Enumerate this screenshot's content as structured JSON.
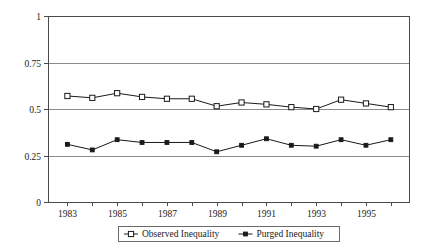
{
  "chart_data": {
    "type": "line",
    "title": "",
    "xlabel": "",
    "ylabel": "",
    "ylim": [
      0,
      1
    ],
    "xlim": [
      1983,
      1996
    ],
    "grid": true,
    "legend_position": "bottom",
    "yticks": [
      "0",
      "0.25",
      "0.5",
      "0.75",
      "1"
    ],
    "ytick_values": [
      0,
      0.25,
      0.5,
      0.75,
      1
    ],
    "x": [
      1983,
      1984,
      1985,
      1986,
      1987,
      1988,
      1989,
      1990,
      1991,
      1992,
      1993,
      1994,
      1995,
      1996
    ],
    "xtick_labels": [
      "1983",
      "",
      "1985",
      "",
      "1987",
      "",
      "1989",
      "",
      "1991",
      "",
      "1993",
      "",
      "1995",
      ""
    ],
    "series": [
      {
        "name": "Observed Inequality",
        "marker": "open-square",
        "values": [
          0.57,
          0.56,
          0.585,
          0.565,
          0.555,
          0.555,
          0.515,
          0.535,
          0.525,
          0.51,
          0.5,
          0.55,
          0.53,
          0.51
        ]
      },
      {
        "name": "Purged Inequality",
        "marker": "filled-diamond",
        "values": [
          0.31,
          0.28,
          0.335,
          0.32,
          0.32,
          0.32,
          0.27,
          0.305,
          0.34,
          0.305,
          0.3,
          0.335,
          0.305,
          0.335
        ]
      }
    ]
  },
  "axes": {
    "y_labels": [
      "1",
      "0.75",
      "0.5",
      "0.25",
      "0"
    ],
    "x_labels": [
      "1983",
      "1985",
      "1987",
      "1989",
      "1991",
      "1993",
      "1995"
    ]
  },
  "legend": {
    "items": [
      {
        "label": "Observed Inequality"
      },
      {
        "label": "Purged Inequality"
      }
    ]
  },
  "colors": {
    "line": "#1a1a1a",
    "grid": "#8a8a8a",
    "axis": "#4a4a4a",
    "background": "#ffffff"
  }
}
